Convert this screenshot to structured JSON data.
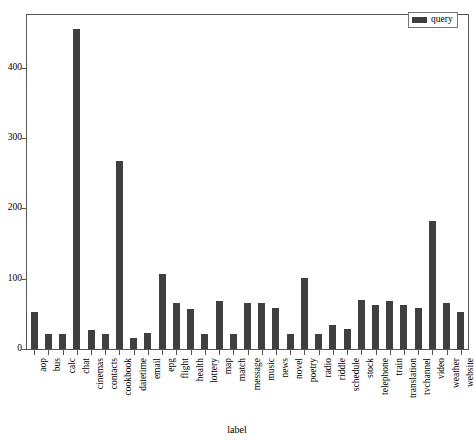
{
  "chart_data": {
    "type": "bar",
    "title": "",
    "xlabel": "label",
    "ylabel": "",
    "ylim": [
      0,
      475
    ],
    "yticks": [
      0,
      100,
      200,
      300,
      400
    ],
    "grid": false,
    "legend_position": "top-right",
    "legend": [
      "query"
    ],
    "bar_color": "#3f3f3f",
    "frame_color": "#555555",
    "background": "#ffffff",
    "categories": [
      "aop",
      "bus",
      "calc",
      "chat",
      "cinemas",
      "contacts",
      "cookbook",
      "datetime",
      "email",
      "epg",
      "flight",
      "health",
      "lottery",
      "map",
      "match",
      "message",
      "music",
      "news",
      "novel",
      "poetry",
      "radio",
      "riddle",
      "schedule",
      "stock",
      "telephone",
      "train",
      "translation",
      "tvchannel",
      "video",
      "weather",
      "website"
    ],
    "series": [
      {
        "name": "query",
        "values": [
          52,
          22,
          22,
          455,
          27,
          22,
          268,
          16,
          23,
          107,
          65,
          57,
          22,
          68,
          22,
          65,
          66,
          58,
          22,
          101,
          22,
          34,
          29,
          69,
          63,
          68,
          62,
          58,
          182,
          66,
          52
        ]
      }
    ]
  },
  "legend": {
    "entries": [
      {
        "label": "query",
        "swatch_name": "legend-swatch-query"
      }
    ]
  },
  "axes": {
    "x_title": "label",
    "y_title": ""
  }
}
